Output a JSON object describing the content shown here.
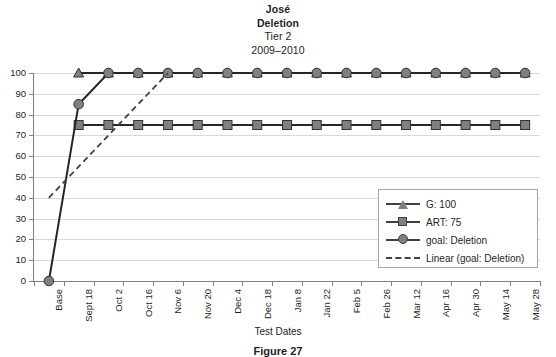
{
  "chart_data": {
    "type": "line",
    "title_lines": [
      {
        "text": "José",
        "bold": true
      },
      {
        "text": "Deletion",
        "bold": true
      },
      {
        "text": "Tier 2",
        "bold": false
      },
      {
        "text": "2009–2010",
        "bold": false
      }
    ],
    "title": "José Deletion Tier 2 2009–2010",
    "xlabel": "Test Dates",
    "ylabel": "",
    "ylim": [
      0,
      100
    ],
    "yticks": [
      0,
      10,
      20,
      30,
      40,
      50,
      60,
      70,
      80,
      90,
      100
    ],
    "grid": "horizontal",
    "legend_position": "inside-lower-right",
    "categories": [
      "Base",
      "Sept 18",
      "Oct 2",
      "Oct 16",
      "Nov 6",
      "Nov 20",
      "Dec 4",
      "Dec 18",
      "Jan 8",
      "Jan 22",
      "Feb 5",
      "Feb 26",
      "Mar 12",
      "Apr 16",
      "Apr 30",
      "May 14",
      "May 28"
    ],
    "series": [
      {
        "name": "G: 100",
        "marker": "triangle",
        "line_style": "solid",
        "color": "#808080",
        "values": [
          null,
          100,
          100,
          100,
          100,
          100,
          100,
          100,
          100,
          100,
          100,
          100,
          100,
          100,
          100,
          100,
          100
        ]
      },
      {
        "name": "ART: 75",
        "marker": "square",
        "line_style": "solid",
        "color": "#808080",
        "values": [
          null,
          75,
          75,
          75,
          75,
          75,
          75,
          75,
          75,
          75,
          75,
          75,
          75,
          75,
          75,
          75,
          75
        ]
      },
      {
        "name": "goal: Deletion",
        "marker": "circle",
        "line_style": "solid",
        "color": "#808080",
        "values": [
          0,
          85,
          100,
          100,
          100,
          100,
          100,
          100,
          100,
          100,
          100,
          100,
          100,
          100,
          100,
          100,
          100
        ]
      },
      {
        "name": "Linear (goal: Deletion)",
        "marker": "none",
        "line_style": "dashed",
        "color": "#404040",
        "trendline": {
          "x_start_index": 0,
          "y_start": 40,
          "x_end_index": 4,
          "y_end": 100
        }
      }
    ]
  },
  "legend": {
    "entries": [
      {
        "label": "G: 100",
        "key": "triangle-line"
      },
      {
        "label": "ART: 75",
        "key": "square-line"
      },
      {
        "label": "goal: Deletion",
        "key": "circle-line"
      },
      {
        "label": "Linear (goal: Deletion)",
        "key": "dashed-line"
      }
    ]
  },
  "caption": "Figure 27"
}
